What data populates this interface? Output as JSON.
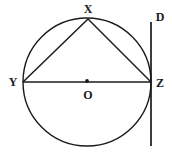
{
  "figure": {
    "kind": "geometry-diagram",
    "background_color": "#ffffff",
    "stroke_color": "#1a1a1a",
    "width": 172,
    "height": 156
  },
  "labels": {
    "x": "X",
    "y": "Y",
    "z": "Z",
    "o": "O",
    "d": "D"
  },
  "geometry": {
    "circle": {
      "cx": 87,
      "cy": 82,
      "r": 64,
      "stroke_width": 1.4
    },
    "center_dot": {
      "cx": 87,
      "cy": 81,
      "r": 1.8
    },
    "points": {
      "X": {
        "x": 88,
        "y": 19
      },
      "Y": {
        "x": 23,
        "y": 82
      },
      "Z": {
        "x": 151,
        "y": 82
      },
      "O": {
        "x": 87,
        "y": 82
      },
      "D": {
        "x": 151,
        "y": 22
      }
    },
    "segments": [
      {
        "name": "diameter-YZ",
        "x1": 23,
        "y1": 82,
        "x2": 151,
        "y2": 82
      },
      {
        "name": "chord-XY",
        "x1": 88,
        "y1": 19,
        "x2": 23,
        "y2": 82
      },
      {
        "name": "chord-XZ",
        "x1": 88,
        "y1": 19,
        "x2": 151,
        "y2": 82
      },
      {
        "name": "tangent-line-D",
        "x1": 151,
        "y1": 22,
        "x2": 151,
        "y2": 146
      }
    ]
  },
  "label_positions": {
    "x": {
      "left": 88,
      "top": 9
    },
    "y": {
      "left": 13,
      "top": 82
    },
    "z": {
      "left": 160,
      "top": 83
    },
    "o": {
      "left": 88,
      "top": 95
    },
    "d": {
      "left": 160,
      "top": 17
    }
  }
}
